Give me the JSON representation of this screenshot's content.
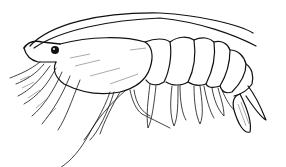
{
  "image": {
    "subject": "shrimp line drawing",
    "style": "black ink illustration on white",
    "background_color": "#ffffff",
    "ink_color": "#111111"
  }
}
